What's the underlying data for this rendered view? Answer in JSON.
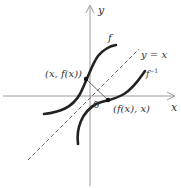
{
  "diagram": {
    "axes": {
      "x_label": "x",
      "y_label": "y",
      "origin_label": "0",
      "axis_color": "#9a9a9a"
    },
    "curves": [
      {
        "name": "f",
        "label": "f",
        "color": "#222222"
      },
      {
        "name": "f-inverse",
        "label": "f",
        "label_sup": "−1",
        "color": "#222222"
      }
    ],
    "reflection_line": {
      "label": "y = x",
      "style": "dashed",
      "color": "#666666"
    },
    "points": [
      {
        "label": "(x, f(x))"
      },
      {
        "label": "(f(x), x)"
      }
    ]
  }
}
